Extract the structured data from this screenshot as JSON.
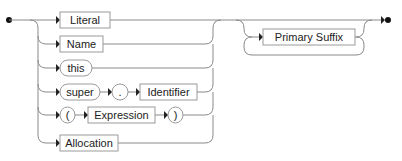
{
  "diagram": {
    "type": "railroad-syntax-diagram",
    "choice_branches": [
      {
        "id": "literal",
        "kind": "nonterminal",
        "items": [
          "Literal"
        ]
      },
      {
        "id": "name",
        "kind": "nonterminal",
        "items": [
          "Name"
        ]
      },
      {
        "id": "this",
        "kind": "terminal",
        "items": [
          "this"
        ]
      },
      {
        "id": "super",
        "kind": "sequence",
        "items": [
          "super",
          ".",
          "Identifier"
        ]
      },
      {
        "id": "paren",
        "kind": "sequence",
        "items": [
          "(",
          "Expression",
          ")"
        ]
      },
      {
        "id": "allocation",
        "kind": "nonterminal",
        "items": [
          "Allocation"
        ]
      }
    ],
    "labels": {
      "literal": "Literal",
      "name": "Name",
      "this": "this",
      "super": "super",
      "dot": ".",
      "identifier": "Identifier",
      "lparen": "(",
      "expression": "Expression",
      "rparen": ")",
      "allocation": "Allocation",
      "primary_suffix": "Primary Suffix"
    },
    "repetition": {
      "item": "Primary Suffix",
      "kind": "zero-or-more"
    },
    "colors": {
      "line": "#8a8a8a",
      "box_border": "#9a9a9a",
      "text": "#222222",
      "marker": "#111111"
    }
  }
}
